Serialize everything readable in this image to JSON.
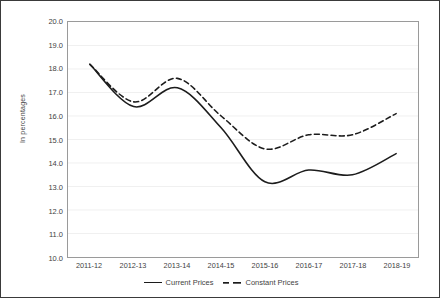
{
  "chart_data": {
    "type": "line",
    "title": "",
    "xlabel": "",
    "ylabel": "In percentages",
    "ylim": [
      10.0,
      20.0
    ],
    "ytick_step": 1.0,
    "grid": true,
    "legend_position": "bottom-center",
    "categories": [
      "2011-12",
      "2012-13",
      "2013-14",
      "2014-15",
      "2015-16",
      "2016-17",
      "2017-18",
      "2018-19"
    ],
    "ytick_labels": [
      "20.0",
      "19.0",
      "18.0",
      "17.0",
      "16.0",
      "15.0",
      "14.0",
      "13.0",
      "12.0",
      "11.0",
      "10.0"
    ],
    "series": [
      {
        "name": "Current Prices",
        "style": "solid",
        "color": "#1c1c1c",
        "values": [
          18.2,
          16.4,
          17.2,
          15.5,
          13.2,
          13.7,
          13.5,
          14.4
        ]
      },
      {
        "name": "Constant Prices",
        "style": "dashed",
        "color": "#1c1c1c",
        "values": [
          18.2,
          16.6,
          17.6,
          16.0,
          14.6,
          15.2,
          15.2,
          16.1
        ]
      }
    ]
  },
  "legend": {
    "items": [
      {
        "label": "Current Prices",
        "style": "solid"
      },
      {
        "label": "Constant Prices",
        "style": "dashed"
      }
    ]
  }
}
